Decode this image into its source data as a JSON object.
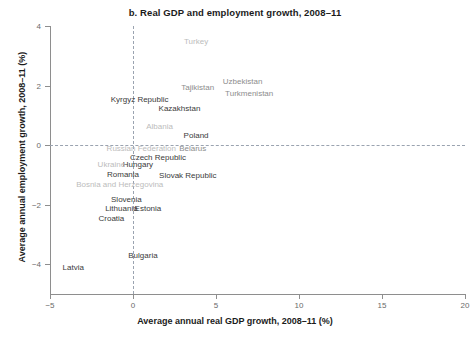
{
  "chart_data": {
    "type": "scatter",
    "title": "b. Real GDP and employment growth, 2008–11",
    "xlabel": "Average annual real GDP growth, 2008–11 (%)",
    "ylabel": "Average annual employment growth, 2008–11 (%)",
    "xlim": [
      -5,
      20
    ],
    "ylim": [
      -5,
      4
    ],
    "xticks": [
      "−5",
      "0",
      "5",
      "10",
      "15",
      "20"
    ],
    "xtick_values": [
      -5,
      0,
      5,
      10,
      15,
      20
    ],
    "yticks": [
      "4",
      "2",
      "0",
      "−2",
      "−4"
    ],
    "ytick_values": [
      4,
      2,
      0,
      -2,
      -4
    ],
    "grid": false,
    "legend": "none",
    "reference_lines": [
      {
        "axis": "y",
        "value": 0,
        "style": "dashed"
      },
      {
        "axis": "x",
        "value": 0,
        "style": "dashed"
      }
    ],
    "label_mode": "text-labels-only",
    "points": [
      {
        "name": "Turkey",
        "x": 3.8,
        "y": 3.5,
        "shade": "light"
      },
      {
        "name": "Tajikistan",
        "x": 3.9,
        "y": 1.95,
        "shade": "mid"
      },
      {
        "name": "Uzbekistan",
        "x": 6.6,
        "y": 2.15,
        "shade": "mid"
      },
      {
        "name": "Turkmenistan",
        "x": 7.0,
        "y": 1.75,
        "shade": "mid"
      },
      {
        "name": "Kyrgyz Republic",
        "x": 0.4,
        "y": 1.55,
        "shade": "dark"
      },
      {
        "name": "Kazakhstan",
        "x": 2.8,
        "y": 1.25,
        "shade": "dark"
      },
      {
        "name": "Albania",
        "x": 1.6,
        "y": 0.63,
        "shade": "light"
      },
      {
        "name": "Poland",
        "x": 3.8,
        "y": 0.33,
        "shade": "dark"
      },
      {
        "name": "Russian Federation",
        "x": 0.5,
        "y": -0.1,
        "shade": "light"
      },
      {
        "name": "Belarus",
        "x": 3.6,
        "y": -0.1,
        "shade": "mid"
      },
      {
        "name": "Czech Republic",
        "x": 1.5,
        "y": -0.4,
        "shade": "dark"
      },
      {
        "name": "Hungary",
        "x": 0.3,
        "y": -0.63,
        "shade": "dark"
      },
      {
        "name": "Ukraine",
        "x": -1.3,
        "y": -0.63,
        "shade": "light"
      },
      {
        "name": "Romania",
        "x": -0.6,
        "y": -0.97,
        "shade": "dark"
      },
      {
        "name": "Slovak Republic",
        "x": 3.3,
        "y": -1.0,
        "shade": "dark"
      },
      {
        "name": "Bosnia and Herzegovina",
        "x": -0.8,
        "y": -1.3,
        "shade": "light"
      },
      {
        "name": "Slovenia",
        "x": -0.4,
        "y": -1.8,
        "shade": "dark"
      },
      {
        "name": "Lithuania",
        "x": -0.7,
        "y": -2.1,
        "shade": "dark"
      },
      {
        "name": "Estonia",
        "x": 0.9,
        "y": -2.1,
        "shade": "dark"
      },
      {
        "name": "Croatia",
        "x": -1.3,
        "y": -2.45,
        "shade": "dark"
      },
      {
        "name": "Bulgaria",
        "x": 0.6,
        "y": -3.7,
        "shade": "dark"
      },
      {
        "name": "Latvia",
        "x": -3.6,
        "y": -4.1,
        "shade": "dark"
      }
    ]
  }
}
